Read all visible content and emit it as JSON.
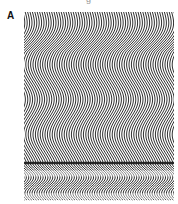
{
  "figure": {
    "panel_label": "A",
    "top_caption_fragment": "g",
    "pattern": {
      "type": "wavy-line-field",
      "line_color": "#1a1a1a",
      "background": "#ffffff",
      "line_spacing_px": 2.4,
      "line_width_px": 0.9,
      "wave_amplitude_px": 7,
      "wave_period_px": 70,
      "noise_band_rows": [
        0.86,
        0.98
      ]
    }
  }
}
